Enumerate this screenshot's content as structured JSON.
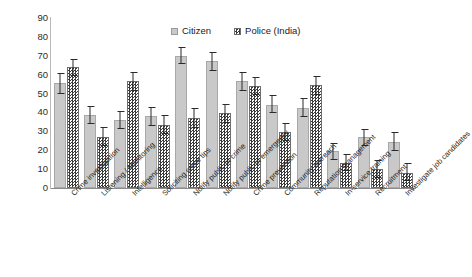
{
  "chart_data": {
    "type": "bar",
    "title": "",
    "subtitle": "",
    "xlabel": "",
    "ylabel": "",
    "ylim": [
      0,
      90
    ],
    "yticks": [
      0,
      10,
      20,
      30,
      40,
      50,
      60,
      70,
      80,
      90
    ],
    "grid": false,
    "legend_position": "top-center",
    "orientation": "vertical",
    "error_bars": true,
    "categories": [
      "Crime investigation",
      "Listening / Monitoring",
      "Intelligence",
      "Soliciting crime tips",
      "Notify public of crime",
      "Notify public of emergency",
      "Crime prevention",
      "Community outreach",
      "Reputation management",
      "In-service training",
      "Recruitment",
      "Investigate job candidates"
    ],
    "series": [
      {
        "name": "Citizen",
        "color": "#c9c9c9",
        "pattern": "solid",
        "values": [
          55.5,
          38.5,
          36.0,
          38.0,
          70.0,
          67.0,
          56.5,
          44.0,
          42.5,
          19.5,
          27.0,
          24.5
        ],
        "error_low": [
          50.0,
          34.0,
          31.0,
          33.0,
          65.5,
          62.0,
          51.5,
          39.5,
          37.5,
          15.0,
          22.5,
          19.5
        ],
        "error_high": [
          61.0,
          43.5,
          41.0,
          43.0,
          74.5,
          72.0,
          61.5,
          49.0,
          47.5,
          24.0,
          31.5,
          29.5
        ]
      },
      {
        "name": "Police (India)",
        "color": "#3a3a3a",
        "pattern": "checkered",
        "values": [
          64.0,
          27.0,
          56.5,
          33.5,
          37.0,
          39.5,
          54.0,
          29.5,
          54.5,
          13.5,
          10.0,
          8.0
        ],
        "error_low": [
          59.5,
          22.0,
          51.5,
          28.5,
          32.0,
          34.5,
          49.0,
          25.0,
          49.5,
          9.0,
          5.5,
          3.5
        ],
        "error_high": [
          68.5,
          32.5,
          61.5,
          38.5,
          42.5,
          44.5,
          59.0,
          34.5,
          59.5,
          18.0,
          15.0,
          13.5
        ]
      }
    ]
  },
  "legend": {
    "items": [
      {
        "label": "Citizen"
      },
      {
        "label": "Police (India)"
      }
    ]
  }
}
